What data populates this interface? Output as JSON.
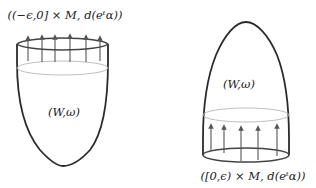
{
  "diagram": {
    "left_cobordism": {
      "top_label": "((−ϵ,0] × M, d(eᵗα))",
      "body_label": "(W,ω)",
      "arrow_count": 6,
      "shape": "cup (concave-down bowl, open at top)",
      "collar_position": "top"
    },
    "right_cobordism": {
      "bottom_label": "([0,ϵ) × M, d(eᵗα))",
      "body_label": "(W,ω)",
      "arrow_count": 5,
      "shape": "dome (capped at top, open at bottom)",
      "collar_position": "bottom"
    },
    "colors": {
      "outline": "#2b2b2b",
      "rim": "#444444",
      "inner_ellipse": "#b5b5b5",
      "arrow": "#555555",
      "text": "#222222"
    }
  }
}
